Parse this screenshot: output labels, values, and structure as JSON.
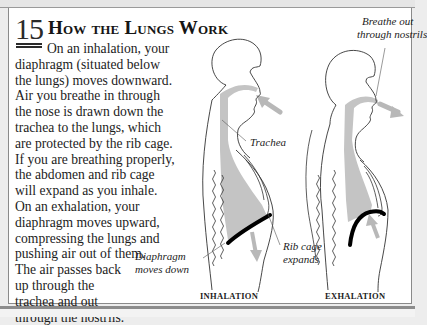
{
  "section": {
    "number": "15",
    "title": "How the Lungs Work"
  },
  "body_lines": [
    "On an inhalation, your",
    "diaphragm (situated below",
    "the lungs) moves downward.",
    "Air you breathe in through",
    "the nose is drawn down the",
    "trachea to the lungs, which",
    "are protected by the rib cage.",
    "If you are breathing properly,",
    "the abdomen and rib cage",
    "will expand as you inhale.",
    "On an exhalation, your",
    "diaphragm moves upward,",
    "compressing the lungs and",
    "pushing air out of them.",
    "The air passes back",
    "up through the",
    "trachea and out",
    "through the nostrils."
  ],
  "illustration": {
    "labels": {
      "breathe_out_1": "Breathe out",
      "breathe_out_2": "through nostrils",
      "trachea": "Trachea",
      "rib_cage_1": "Rib cage",
      "rib_cage_2": "expands",
      "diaphragm_1": "Diaphragm",
      "diaphragm_2": "moves down"
    },
    "captions": {
      "inhalation": "INHALATION",
      "exhalation": "EXHALATION"
    },
    "colors": {
      "lung_fill": "#c4c4c4",
      "airflow_arrow": "#b8b8b8",
      "diaphragm": "#000000",
      "outline": "#333333"
    }
  }
}
